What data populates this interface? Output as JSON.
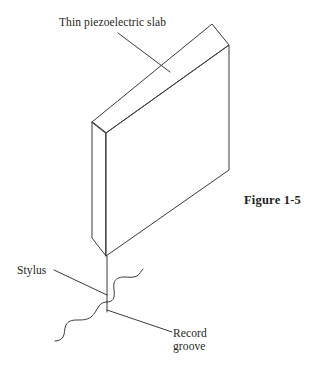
{
  "figure": {
    "caption": "Figure 1-5",
    "background_color": "#ffffff",
    "line_color": "#3a3a3a",
    "text_color": "#231f20"
  },
  "labels": {
    "slab": "Thin piezoelectric slab",
    "stylus": "Stylus",
    "groove_line1": "Record",
    "groove_line2": "groove"
  },
  "diagram": {
    "type": "technical-line-drawing",
    "parts": [
      "thin piezoelectric slab",
      "stylus",
      "record groove"
    ]
  }
}
